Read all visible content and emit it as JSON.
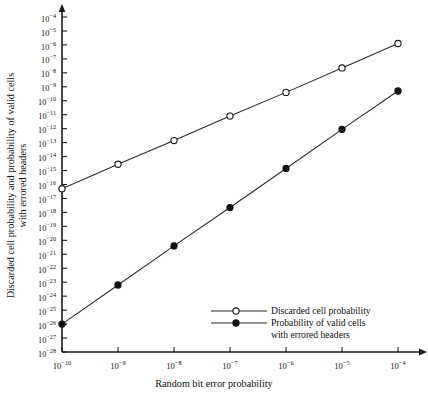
{
  "chart_data": {
    "type": "line",
    "title": "",
    "xlabel": "Random bit error probability",
    "ylabel": "Discarded cell probability and probability of valid cells with errored headers",
    "xscale": "log",
    "yscale": "log",
    "grid": false,
    "xlim": [
      1e-10,
      0.0001
    ],
    "ylim": [
      1e-28,
      0.0001
    ],
    "x": [
      1e-10,
      1e-09,
      1e-08,
      1e-07,
      1e-06,
      1e-05,
      0.0001
    ],
    "x_exponents": [
      -10,
      -9,
      -8,
      -7,
      -6,
      -5,
      -4
    ],
    "y_exponents": [
      -4,
      -5,
      -6,
      -7,
      -8,
      -9,
      -10,
      -11,
      -12,
      -13,
      -14,
      -15,
      -16,
      -17,
      -18,
      -19,
      -20,
      -21,
      -22,
      -23,
      -24,
      -25,
      -26,
      -27,
      -28
    ],
    "xticklabels": [
      "10-10",
      "10-9",
      "10-8",
      "10-7",
      "10-6",
      "10-5",
      "10-4"
    ],
    "series": [
      {
        "name": "Discarded cell probability",
        "marker": "open-circle",
        "values_exponent": [
          -16.3,
          -14.55,
          -12.85,
          -11.1,
          -9.4,
          -7.65,
          -5.9
        ],
        "values": [
          5e-17,
          2.8e-15,
          1.4e-13,
          7.9e-12,
          4e-10,
          2.2e-08,
          1.3e-06
        ]
      },
      {
        "name": "Probability of valid cells with errored headers",
        "marker": "filled-circle",
        "values_exponent": [
          -26.0,
          -23.2,
          -20.4,
          -17.65,
          -14.85,
          -12.05,
          -9.3
        ],
        "values": [
          1e-26,
          6.3e-24,
          4e-21,
          2.2e-18,
          1.4e-15,
          8.9e-13,
          5e-10
        ]
      }
    ],
    "legend": {
      "position": "lower-right",
      "entries": [
        {
          "marker": "open-circle",
          "label_line1": "Discarded cell probability",
          "label_line2": ""
        },
        {
          "marker": "filled-circle",
          "label_line1": "Probability of valid cells",
          "label_line2": "with errored headers"
        }
      ]
    },
    "colors": {
      "axis": "#1a1a1a",
      "line": "#2a2a2a",
      "marker_fill_open": "#ffffff",
      "marker_fill_filled": "#111111",
      "background": "#ffffff"
    }
  }
}
